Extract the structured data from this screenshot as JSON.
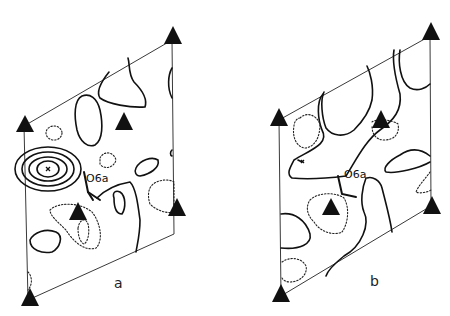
{
  "figure": {
    "panels": [
      {
        "id": "a",
        "label": "a",
        "atom_label": "O6a"
      },
      {
        "id": "b",
        "label": "b",
        "atom_label": "O6a"
      }
    ],
    "legend": {
      "solid_contours": "positive density",
      "dashed_contours": "negative density",
      "triangle_markers": "threefold axis symbols"
    },
    "colors": {
      "ink": "#111111",
      "background": "#ffffff"
    }
  }
}
